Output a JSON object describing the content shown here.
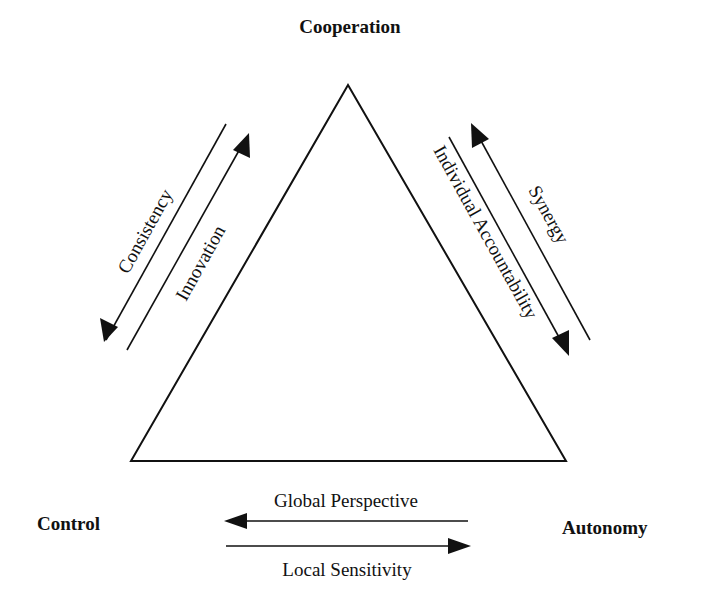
{
  "diagram": {
    "corners": {
      "top": "Cooperation",
      "left": "Control",
      "right": "Autonomy"
    },
    "edges": {
      "left_side": {
        "outer": {
          "label": "Consistency",
          "direction": "toward Control"
        },
        "inner": {
          "label": "Innovation",
          "direction": "toward Cooperation"
        }
      },
      "right_side": {
        "inner": {
          "label": "Individual Accountability",
          "direction": "toward Autonomy"
        },
        "outer": {
          "label": "Synergy",
          "direction": "toward Cooperation"
        }
      },
      "bottom": {
        "upper": {
          "label": "Global Perspective",
          "direction": "toward Control"
        },
        "lower": {
          "label": "Local Sensitivity",
          "direction": "toward Autonomy"
        }
      }
    },
    "colors": {
      "stroke": "#111111",
      "background": "#ffffff"
    }
  }
}
